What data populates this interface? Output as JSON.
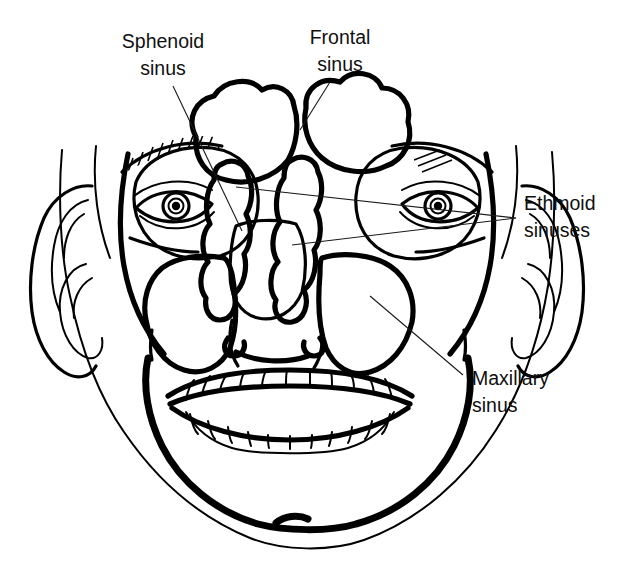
{
  "figure": {
    "background_color": "#ffffff",
    "ink_color": "#000000",
    "width": 628,
    "height": 567
  },
  "labels": [
    {
      "id": "sphenoid",
      "line1": "Sphenoid",
      "line2": "sinus",
      "text_anchor": "middle",
      "x": 163,
      "y1": 48,
      "y2": 75,
      "pattern": "horizontal-lines",
      "leaders": [
        {
          "x1": 173,
          "y1": 86,
          "x2": 242,
          "y2": 231
        }
      ]
    },
    {
      "id": "frontal",
      "line1": "Frontal",
      "line2": "sinus",
      "text_anchor": "middle",
      "x": 340,
      "y1": 44,
      "y2": 71,
      "pattern": "diagonal-hatch-backslash",
      "leaders": [
        {
          "x1": 330,
          "y1": 82,
          "x2": 300,
          "y2": 130
        }
      ]
    },
    {
      "id": "ethmoid",
      "line1": "Ethmoid",
      "line2": "sinuses",
      "text_anchor": "start",
      "x": 524,
      "y1": 210,
      "y2": 237,
      "pattern": "stipple",
      "leaders": [
        {
          "x1": 516,
          "y1": 218,
          "x2": 236,
          "y2": 187
        },
        {
          "x1": 516,
          "y1": 218,
          "x2": 292,
          "y2": 245
        }
      ]
    },
    {
      "id": "maxillary",
      "line1": "Maxillary",
      "line2": "sinus",
      "text_anchor": "start",
      "x": 472,
      "y1": 385,
      "y2": 412,
      "pattern": "diagonal-hatch-slash",
      "leaders": [
        {
          "x1": 463,
          "y1": 375,
          "x2": 370,
          "y2": 296
        }
      ]
    }
  ],
  "structures": [
    {
      "id": "face-outline",
      "name": "face and scalp outline"
    },
    {
      "id": "mandible",
      "name": "mandible / jaw outline"
    },
    {
      "id": "left-ear",
      "name": "left ear"
    },
    {
      "id": "right-ear",
      "name": "right ear"
    },
    {
      "id": "left-eye",
      "name": "left eye with eyebrow"
    },
    {
      "id": "right-eye",
      "name": "right eye with eyebrow"
    },
    {
      "id": "nose",
      "name": "nasal aperture"
    },
    {
      "id": "upper-teeth",
      "name": "upper dental arch"
    },
    {
      "id": "lower-teeth",
      "name": "lower dental arch"
    },
    {
      "id": "frontal-sinus",
      "name": "frontal sinus, two lobes, diagonal hatch"
    },
    {
      "id": "ethmoid-sinuses",
      "name": "ethmoid sinuses, paired stippled columns"
    },
    {
      "id": "sphenoid-sinus",
      "name": "sphenoid sinus, horizontal line fill"
    },
    {
      "id": "maxillary-sinuses",
      "name": "maxillary sinuses, paired diagonal hatch"
    }
  ]
}
